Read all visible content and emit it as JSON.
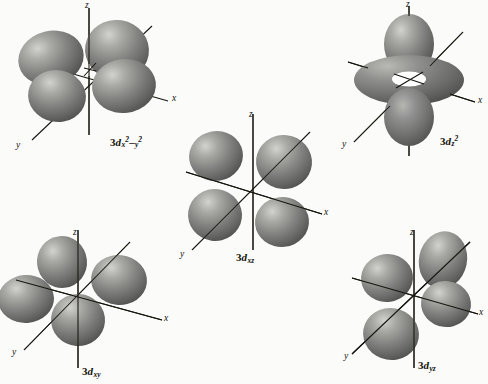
{
  "figure": {
    "background_color": "#fbfbf9",
    "ink_color": "#15130f",
    "lobe_fill": "#7b7b79",
    "lobe_highlight": "#c9c9c5",
    "lobe_shadow": "#4e4e4c",
    "torus_hole_color": "#ffffff"
  },
  "axis_labels": {
    "z": "z",
    "x": "x",
    "y": "y"
  },
  "orbitals": [
    {
      "id": "3d-x2-y2",
      "name": "3d x2-y2",
      "prefix": "3d",
      "subscript_plain": "x2-y2",
      "label_parts": {
        "n": "3",
        "d": "d",
        "s1": "x",
        "p1": "2",
        "dash": "–",
        "s2": "y",
        "p2": "2"
      },
      "lobe_count": 4,
      "lobe_arrangement": "along-axes",
      "plane": "xy",
      "has_torus": false
    },
    {
      "id": "3d-z2",
      "name": "3d z2",
      "prefix": "3d",
      "subscript_plain": "z2",
      "label_parts": {
        "n": "3",
        "d": "d",
        "s1": "z",
        "p1": "2"
      },
      "lobe_count": 2,
      "lobe_arrangement": "along-z-with-torus",
      "plane": "z",
      "has_torus": true
    },
    {
      "id": "3d-xz",
      "name": "3d xz",
      "prefix": "3d",
      "subscript_plain": "xz",
      "label_parts": {
        "n": "3",
        "d": "d",
        "s1": "xz"
      },
      "lobe_count": 4,
      "lobe_arrangement": "between-axes",
      "plane": "xz",
      "has_torus": false
    },
    {
      "id": "3d-xy",
      "name": "3d xy",
      "prefix": "3d",
      "subscript_plain": "xy",
      "label_parts": {
        "n": "3",
        "d": "d",
        "s1": "xy"
      },
      "lobe_count": 4,
      "lobe_arrangement": "between-axes",
      "plane": "xy",
      "has_torus": false
    },
    {
      "id": "3d-yz",
      "name": "3d yz",
      "prefix": "3d",
      "subscript_plain": "yz",
      "label_parts": {
        "n": "3",
        "d": "d",
        "s1": "yz"
      },
      "lobe_count": 4,
      "lobe_arrangement": "between-axes",
      "plane": "yz",
      "has_torus": false
    }
  ]
}
